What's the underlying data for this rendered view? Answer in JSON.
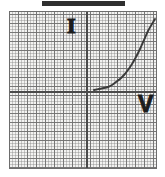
{
  "figure": {
    "title_bar": {
      "name": "redaction-bar",
      "color": "#2f2f2f"
    },
    "axis_labels": {
      "vertical": "I",
      "horizontal": "V"
    },
    "colors": {
      "paper": "#f0f0ee",
      "minor_grid": "#6e6e6e",
      "major_grid": "#555555",
      "axis": "#4a4a4a",
      "curve": "#3a3a3a",
      "border": "#6d6d6d",
      "label": "#1c1c1c"
    }
  },
  "chart_data": {
    "type": "line",
    "title": "",
    "subtitle": "",
    "xlabel": "V",
    "ylabel": "I",
    "grid": true,
    "legend": "none",
    "axis_origin_px": [
      76,
      79
    ],
    "xlim": [
      -8.4,
      7.8
    ],
    "ylim": [
      -8.6,
      8.8
    ],
    "series": [
      {
        "name": "diode-iv-curve",
        "color": "#3a3a3a",
        "x": [
          0.9,
          1.4,
          1.9,
          2.3,
          2.7,
          3.1,
          3.5,
          3.9,
          4.3,
          4.7,
          5.1,
          5.5,
          5.9,
          6.3,
          6.7,
          7.0
        ],
        "y": [
          0.05,
          0.1,
          0.22,
          0.38,
          0.6,
          0.9,
          1.28,
          1.75,
          2.32,
          3.0,
          3.78,
          4.65,
          5.6,
          6.62,
          7.3,
          7.85
        ]
      }
    ],
    "points_px": [
      [
        84,
        78
      ],
      [
        89,
        77
      ],
      [
        94,
        76
      ],
      [
        98,
        75
      ],
      [
        102,
        73
      ],
      [
        106,
        70
      ],
      [
        110,
        67
      ],
      [
        114,
        63
      ],
      [
        118,
        58
      ],
      [
        122,
        52
      ],
      [
        126,
        45
      ],
      [
        130,
        37
      ],
      [
        134,
        28
      ],
      [
        138,
        19
      ],
      [
        142,
        12
      ],
      [
        145,
        7
      ]
    ]
  }
}
